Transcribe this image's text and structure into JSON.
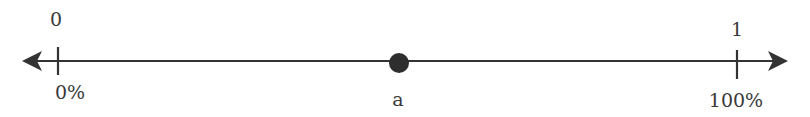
{
  "number_line": {
    "start": {
      "value_label": "0",
      "percent_label": "0%"
    },
    "end": {
      "value_label": "1",
      "percent_label": "100%"
    },
    "point": {
      "label": "a"
    },
    "colors": {
      "line": "#333333",
      "text": "#3a3a3a",
      "point": "#2e2e2e"
    }
  }
}
